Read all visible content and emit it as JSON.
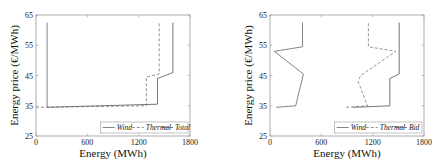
{
  "chart_data": [
    {
      "type": "line",
      "title": "",
      "xlabel": "Energy (MWh)",
      "ylabel": "Energy price (€/MWh)",
      "xlim": [
        0,
        1800
      ],
      "ylim": [
        25,
        65
      ],
      "xticks": [
        0,
        600,
        1200,
        1800
      ],
      "yticks": [
        25,
        35,
        45,
        55,
        65
      ],
      "grid": false,
      "legend_position": "lower right",
      "series": [
        {
          "name": "Wind",
          "style": "solid",
          "color": "#777777",
          "points": [
            [
              130,
              62.5
            ],
            [
              130,
              34.5
            ]
          ]
        },
        {
          "name": "Thermal",
          "style": "dashed",
          "color": "#888888",
          "points": [
            [
              0,
              34.5
            ],
            [
              1290,
              35
            ],
            [
              1290,
              44.5
            ],
            [
              1440,
              45.5
            ],
            [
              1440,
              62.5
            ]
          ]
        },
        {
          "name": "Total",
          "style": "solid",
          "color": "#666666",
          "points": [
            [
              130,
              34.5
            ],
            [
              1420,
              35.5
            ],
            [
              1420,
              44
            ],
            [
              1600,
              46
            ],
            [
              1600,
              62.5
            ]
          ]
        }
      ]
    },
    {
      "type": "line",
      "title": "",
      "xlabel": "Energy (MWh)",
      "ylabel": "Energy price (€/MWh)",
      "xlim": [
        0,
        1800
      ],
      "ylim": [
        25,
        65
      ],
      "xticks": [
        0,
        600,
        1200,
        1800
      ],
      "yticks": [
        25,
        35,
        45,
        55,
        65
      ],
      "grid": false,
      "legend_position": "lower right",
      "series": [
        {
          "name": "Wind",
          "style": "solid",
          "color": "#777777",
          "points": [
            [
              70,
              34.5
            ],
            [
              300,
              35
            ],
            [
              390,
              45.5
            ],
            [
              50,
              53
            ],
            [
              380,
              54.5
            ],
            [
              380,
              62.5
            ]
          ]
        },
        {
          "name": "Thermal",
          "style": "dashed",
          "color": "#888888",
          "points": [
            [
              890,
              34.5
            ],
            [
              1140,
              35
            ],
            [
              1030,
              43
            ],
            [
              1060,
              45
            ],
            [
              1470,
              53
            ],
            [
              1150,
              54.5
            ],
            [
              1150,
              62.5
            ]
          ]
        },
        {
          "name": "Bid",
          "style": "solid",
          "color": "#666666",
          "points": [
            [
              970,
              34.5
            ],
            [
              1400,
              35
            ],
            [
              1400,
              44
            ],
            [
              1510,
              45.5
            ],
            [
              1510,
              62.5
            ]
          ]
        }
      ]
    }
  ],
  "labels": {
    "xlabel": "Energy (MWh)",
    "ylabel": "Energy price (€/MWh)",
    "xticks": [
      "0",
      "600",
      "1200",
      "1800"
    ],
    "yticks": [
      "65",
      "55",
      "45",
      "35",
      "25"
    ],
    "legend_left": [
      "Wind",
      "Thermal",
      "Total"
    ],
    "legend_right": [
      "Wind",
      "Thermal",
      "Bid"
    ]
  }
}
